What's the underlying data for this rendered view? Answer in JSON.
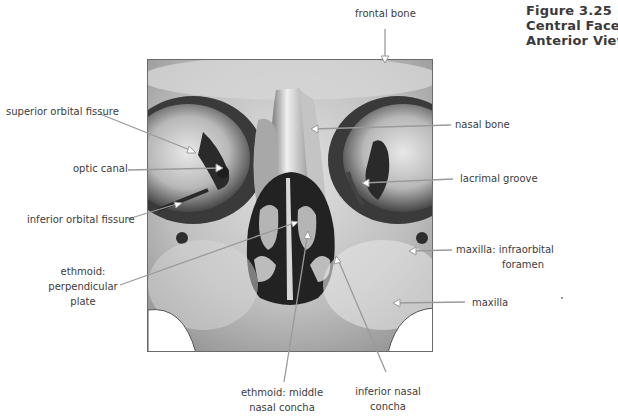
{
  "figure": {
    "title_lines": [
      "Figure 3.25",
      "Central Face,",
      "Anterior View"
    ]
  },
  "labels": {
    "frontal_bone": "frontal bone",
    "superior_orbital_fissure": "superior orbital fissure",
    "optic_canal": "optic canal",
    "inferior_orbital_fissure": "inferior orbital fissure",
    "ethmoid_perpendicular_plate": [
      "ethmoid:",
      "perpendicular",
      "plate"
    ],
    "nasal_bone": "nasal bone",
    "lacrimal_groove": "lacrimal groove",
    "maxilla_infraorbital_foramen": [
      "maxilla: infraorbital",
      "foramen"
    ],
    "maxilla": "maxilla",
    "ethmoid_middle_nasal_concha": [
      "ethmoid: middle",
      "nasal concha"
    ],
    "inferior_nasal_concha": [
      "inferior nasal",
      "concha"
    ]
  },
  "colors": {
    "text": "#3c3c3c",
    "leader_line": "#9a9a9a",
    "frame_border": "#6a6a6a"
  }
}
